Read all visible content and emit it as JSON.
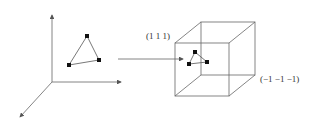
{
  "diagram": {
    "left_panel": {
      "description": "3D coordinate axes with a triangle of three points",
      "axes": [
        "y-up",
        "x-right",
        "z-toward-viewer"
      ],
      "triangle_vertices": 3
    },
    "arrow": {
      "direction": "left-to-right",
      "meaning": "mapping into normalized cube"
    },
    "right_panel": {
      "description": "wireframe cube containing the mapped triangle",
      "corner_label_top": "(1 1 1)",
      "corner_label_bottom": "(−1 −1 −1)"
    },
    "colors": {
      "stroke": "#555555",
      "point": "#111111",
      "background": "#ffffff"
    }
  }
}
